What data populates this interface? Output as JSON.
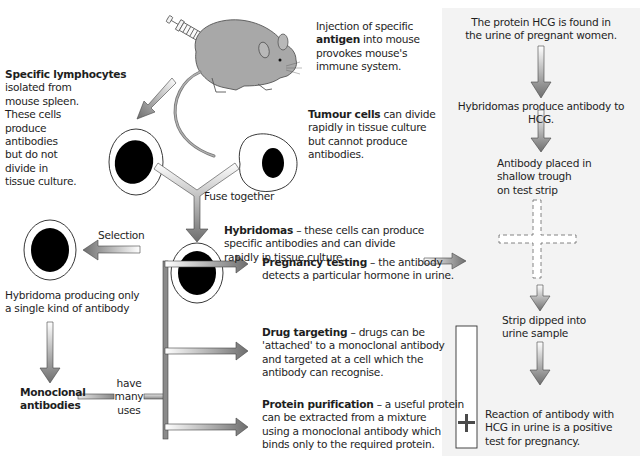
{
  "left_flow": {
    "injection": {
      "pre": "Injection of specific",
      "bold": "antigen",
      "post": " into mouse",
      "line3": "provokes mouse's",
      "line4": "immune system."
    },
    "lymphocytes": {
      "bold": "Specific lymphocytes",
      "lines": [
        "isolated from",
        "mouse spleen.",
        "These cells",
        "produce",
        "antibodies",
        "but do not",
        "divide in",
        "tissue culture."
      ]
    },
    "tumour": {
      "bold": "Tumour cells",
      "post": " can divide",
      "lines": [
        "rapidly in tissue culture",
        "but cannot produce",
        "antibodies."
      ]
    },
    "fuse_label": "Fuse together",
    "hybridomas": {
      "bold": "Hybridomas",
      "post": " – these cells can produce",
      "lines": [
        "specific antibodies and can divide",
        "rapidly in tissue culture."
      ]
    },
    "selection_label": "Selection",
    "single_hybridoma": {
      "line1": "Hybridoma producing only",
      "line2": "a single kind of antibody"
    },
    "monoclonal": {
      "line1": "Monoclonal",
      "line2": "antibodies"
    },
    "have_many_uses": [
      "have",
      "many",
      "uses"
    ]
  },
  "uses": [
    {
      "bold": "Pregnancy testing",
      "post": " – the antibody",
      "lines": [
        "detects a particular hormone in urine."
      ]
    },
    {
      "bold": "Drug targeting",
      "post": " – drugs can be",
      "lines": [
        "'attached' to a monoclonal antibody",
        "and targeted at a cell which the",
        "antibody can recognise."
      ]
    },
    {
      "bold": "Protein purification",
      "post": " – a useful protein",
      "lines": [
        "can be extracted from a mixture",
        "using a monoclonal antibody which",
        "binds only to the required protein."
      ]
    }
  ],
  "pregnancy_panel": {
    "step1": [
      "The protein HCG is found in",
      "the urine of pregnant women."
    ],
    "step2": "Hybridomas produce antibody to HCG.",
    "step3": [
      "Antibody placed in",
      "shallow trough",
      "on test strip"
    ],
    "step4": [
      "Strip dipped into",
      "urine sample"
    ],
    "step5": [
      "Reaction of antibody with",
      "HCG in urine is a positive",
      "test for pregnancy."
    ]
  },
  "colors": {
    "panel_bg": "#f3f3f3",
    "arrow_dark": "#6e6e6e",
    "arrow_light": "#ffffff",
    "mouse": "#a8a8a8",
    "nucleus": "#000000"
  }
}
